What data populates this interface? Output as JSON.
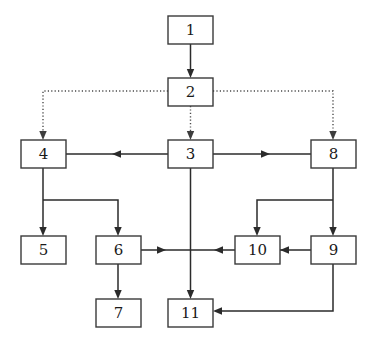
{
  "diagram": {
    "canvas": {
      "width": 375,
      "height": 345,
      "background": "#ffffff"
    },
    "style": {
      "node_fill": "#ffffff",
      "node_stroke": "#3a3a3a",
      "solid_edge_color": "#2b2b2b",
      "dotted_edge_color": "#4a4a4a",
      "label_color": "#1a1a1a"
    },
    "nodes": [
      {
        "id": "n1",
        "label": "1",
        "x": 168,
        "y": 16,
        "w": 45,
        "h": 28
      },
      {
        "id": "n2",
        "label": "2",
        "x": 168,
        "y": 78,
        "w": 45,
        "h": 28
      },
      {
        "id": "n4",
        "label": "4",
        "x": 21,
        "y": 140,
        "w": 45,
        "h": 28
      },
      {
        "id": "n3",
        "label": "3",
        "x": 168,
        "y": 140,
        "w": 45,
        "h": 28
      },
      {
        "id": "n8",
        "label": "8",
        "x": 311,
        "y": 140,
        "w": 45,
        "h": 28
      },
      {
        "id": "n5",
        "label": "5",
        "x": 21,
        "y": 236,
        "w": 45,
        "h": 28
      },
      {
        "id": "n6",
        "label": "6",
        "x": 96,
        "y": 236,
        "w": 45,
        "h": 28
      },
      {
        "id": "n10",
        "label": "10",
        "x": 235,
        "y": 236,
        "w": 45,
        "h": 28
      },
      {
        "id": "n9",
        "label": "9",
        "x": 311,
        "y": 236,
        "w": 45,
        "h": 28
      },
      {
        "id": "n7",
        "label": "7",
        "x": 96,
        "y": 299,
        "w": 45,
        "h": 28
      },
      {
        "id": "n11",
        "label": "11",
        "x": 168,
        "y": 299,
        "w": 45,
        "h": 28
      }
    ],
    "edges": [
      {
        "id": "e1",
        "from": "n1",
        "to": "n2",
        "style": "solid",
        "arrow": "down"
      },
      {
        "id": "e2",
        "from": "n2",
        "to": "n4",
        "style": "dotted",
        "arrow": "down"
      },
      {
        "id": "e3",
        "from": "n2",
        "to": "n3",
        "style": "dotted",
        "arrow": "down"
      },
      {
        "id": "e4",
        "from": "n2",
        "to": "n8",
        "style": "dotted",
        "arrow": "down"
      },
      {
        "id": "e5",
        "from": "n3",
        "to": "n4",
        "style": "solid",
        "arrow": "left"
      },
      {
        "id": "e6",
        "from": "n3",
        "to": "n8",
        "style": "solid",
        "arrow": "right"
      },
      {
        "id": "e7",
        "from": "n4",
        "to": "n5",
        "style": "solid",
        "arrow": "down"
      },
      {
        "id": "e8",
        "from": "n4",
        "to": "n6",
        "style": "solid",
        "arrow": "down"
      },
      {
        "id": "e9",
        "from": "n6",
        "to": "n7",
        "style": "solid",
        "arrow": "down"
      },
      {
        "id": "e10",
        "from": "n8",
        "to": "n10",
        "style": "solid",
        "arrow": "down"
      },
      {
        "id": "e11",
        "from": "n8",
        "to": "n9",
        "style": "solid",
        "arrow": "down"
      },
      {
        "id": "e12",
        "from": "n9",
        "to": "n10",
        "style": "solid",
        "arrow": "left"
      },
      {
        "id": "e13",
        "from": "n6",
        "to": "n11",
        "style": "solid",
        "arrow": "right"
      },
      {
        "id": "e14",
        "from": "n10",
        "to": "n11",
        "style": "solid",
        "arrow": "left"
      },
      {
        "id": "e15",
        "from": "n3",
        "to": "n11",
        "style": "solid",
        "arrow": "down"
      },
      {
        "id": "e16",
        "from": "n9",
        "to": "n11",
        "style": "solid",
        "arrow": "left"
      }
    ]
  }
}
